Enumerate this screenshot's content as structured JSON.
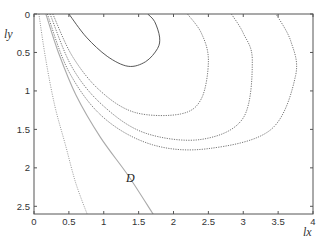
{
  "chart_data": {
    "type": "line",
    "title": "",
    "xlabel": "lx",
    "ylabel": "ly",
    "xlim": [
      0,
      4
    ],
    "ylim": [
      0,
      2.6
    ],
    "y_inverted": true,
    "grid": false,
    "legend": null,
    "x_ticks": [
      0,
      0.5,
      1,
      1.5,
      2,
      2.5,
      3,
      3.5,
      4
    ],
    "x_tick_labels": [
      "0",
      "0.5",
      "1",
      "1.5",
      "2",
      "2.5",
      "3",
      "3.5",
      "4"
    ],
    "y_ticks": [
      0,
      0.5,
      1,
      1.5,
      2,
      2.5
    ],
    "y_tick_labels": [
      "0",
      "0.5",
      "1",
      "1.5",
      "2",
      "2.5"
    ],
    "annotations": [
      {
        "text": "D",
        "x": 1.37,
        "y": 2.1
      }
    ],
    "series": [
      {
        "name": "closed contour 1 (solid)",
        "style": "solid",
        "points": [
          [
            0.5,
            0.0
          ],
          [
            0.75,
            0.3
          ],
          [
            1.05,
            0.55
          ],
          [
            1.35,
            0.68
          ],
          [
            1.6,
            0.62
          ],
          [
            1.77,
            0.45
          ],
          [
            1.8,
            0.3
          ],
          [
            1.73,
            0.1
          ],
          [
            1.63,
            0.0
          ]
        ]
      },
      {
        "name": "contour 2 (dotted)",
        "style": "dotted",
        "points": [
          [
            0.27,
            0.0
          ],
          [
            0.55,
            0.55
          ],
          [
            0.95,
            1.0
          ],
          [
            1.45,
            1.28
          ],
          [
            2.1,
            1.3
          ],
          [
            2.4,
            1.1
          ],
          [
            2.5,
            0.6
          ],
          [
            2.4,
            0.25
          ],
          [
            2.2,
            0.0
          ]
        ]
      },
      {
        "name": "contour 3 (dotted)",
        "style": "dotted",
        "points": [
          [
            0.23,
            0.0
          ],
          [
            0.55,
            0.7
          ],
          [
            1.0,
            1.2
          ],
          [
            1.6,
            1.55
          ],
          [
            2.4,
            1.63
          ],
          [
            3.0,
            1.35
          ],
          [
            3.13,
            0.6
          ],
          [
            3.0,
            0.25
          ],
          [
            2.83,
            0.0
          ]
        ]
      },
      {
        "name": "contour 4 (dotted)",
        "style": "dotted",
        "points": [
          [
            0.19,
            0.0
          ],
          [
            0.5,
            0.75
          ],
          [
            1.0,
            1.35
          ],
          [
            1.7,
            1.7
          ],
          [
            2.5,
            1.75
          ],
          [
            3.4,
            1.5
          ],
          [
            3.75,
            0.8
          ],
          [
            3.68,
            0.35
          ],
          [
            3.47,
            0.0
          ]
        ]
      },
      {
        "name": "boundary curve (dotted, leftmost)",
        "style": "dotted",
        "points": [
          [
            0.07,
            0.0
          ],
          [
            0.17,
            0.6
          ],
          [
            0.3,
            1.2
          ],
          [
            0.45,
            1.7
          ],
          [
            0.6,
            2.2
          ],
          [
            0.77,
            2.62
          ]
        ]
      },
      {
        "name": "D",
        "style": "solid-light",
        "points": [
          [
            0.17,
            0.0
          ],
          [
            0.35,
            0.5
          ],
          [
            0.6,
            1.05
          ],
          [
            0.95,
            1.6
          ],
          [
            1.35,
            2.1
          ],
          [
            1.72,
            2.62
          ]
        ]
      }
    ]
  }
}
